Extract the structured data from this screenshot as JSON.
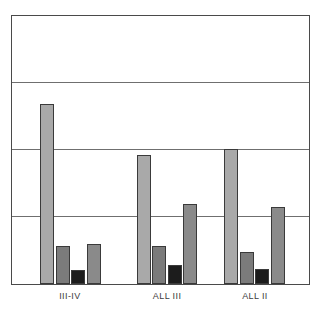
{
  "chart_data": {
    "type": "bar",
    "title": "",
    "subtitle": "",
    "xlabel": "",
    "ylabel": "",
    "categories": [
      "III-IV",
      "ALL III",
      "ALL II"
    ],
    "ylim": [
      0,
      4
    ],
    "yticks": [
      0,
      1,
      2,
      3,
      4
    ],
    "ytick_labels": [
      "",
      "",
      "",
      "",
      ""
    ],
    "grid": "horizontal",
    "legend": "none",
    "bar_border_color": "#3a3a3a",
    "frame_color": "#4a4a4a",
    "gridline_color": "#6f6f6f",
    "series": [
      {
        "name": "series-1",
        "color": "#a9a9a9",
        "values": [
          2.69,
          1.93,
          2.01
        ]
      },
      {
        "name": "series-2",
        "color": "#7b7b7b",
        "values": [
          0.57,
          0.57,
          0.48
        ]
      },
      {
        "name": "series-3",
        "color": "#1c1c1c",
        "values": [
          0.21,
          0.28,
          0.22
        ]
      },
      {
        "name": "series-4",
        "color": "#8a8a8a",
        "values": [
          0.6,
          1.19,
          1.15
        ]
      }
    ],
    "group_geometry": [
      {
        "category": "III-IV",
        "center_pct": 19.7
      },
      {
        "category": "ALL III",
        "center_pct": 52.2
      },
      {
        "category": "ALL II",
        "center_pct": 81.6
      }
    ],
    "bar_width_pct": 4.7,
    "bar_gap_pct": 0.55
  }
}
